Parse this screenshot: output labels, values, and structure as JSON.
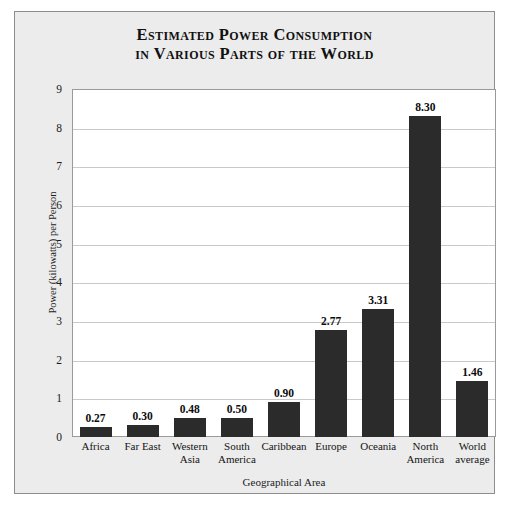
{
  "figure": {
    "title_line1": "Estimated Power Consumption",
    "title_line2": "in Various Parts of the World",
    "frame_color": "#8d8d8d",
    "frame_background": "#ececec",
    "plot_background": "#ffffff",
    "bar_color": "#2b2b2b",
    "gridline_color": "#c9c9c9"
  },
  "chart_data": {
    "type": "bar",
    "title": "Estimated Power Consumption in Various Parts of the World",
    "xlabel": "Geographical Area",
    "ylabel": "Power (kilowatts) per Person",
    "categories": [
      "Africa",
      "Far East",
      "Western Asia",
      "South America",
      "Caribbean",
      "Europe",
      "Oceania",
      "North America",
      "World average"
    ],
    "values": [
      0.27,
      0.3,
      0.48,
      0.5,
      0.9,
      2.77,
      3.31,
      8.3,
      1.46
    ],
    "value_labels": [
      "0.27",
      "0.30",
      "0.48",
      "0.50",
      "0.90",
      "2.77",
      "3.31",
      "8.30",
      "1.46"
    ],
    "ylim": [
      0,
      9
    ],
    "yticks": [
      0,
      1,
      2,
      3,
      4,
      5,
      6,
      7,
      8,
      9
    ],
    "ytick_labels": [
      "0",
      "1",
      "2",
      "3",
      "4",
      "5",
      "6",
      "7",
      "8",
      "9"
    ],
    "grid": true,
    "grid_axis": "y",
    "legend": false,
    "legend_position": "none"
  }
}
